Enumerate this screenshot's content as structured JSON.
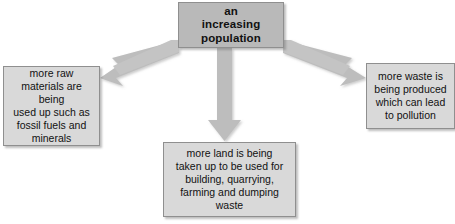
{
  "diagram": {
    "type": "cause-and-effect flowchart",
    "colors": {
      "background": "#ffffff",
      "cause_box_fill": "#b9b9b9",
      "effect_box_fill": "#d9d9d9",
      "box_border": "#8f8f8f",
      "arrow_fill": "#bdbdbd",
      "text": "#111111"
    },
    "cause": {
      "id": "increasing-population",
      "label": "an\nincreasing\npopulation"
    },
    "effects": [
      {
        "id": "raw-materials",
        "label": "more raw\nmaterials are being\nused up such as\nfossil fuels and\nminerals"
      },
      {
        "id": "land-use",
        "label": "more land is being\ntaken up to be used for\nbuilding, quarrying,\nfarming and dumping\nwaste"
      },
      {
        "id": "waste",
        "label": "more waste is\nbeing produced\nwhich can lead\nto pollution"
      }
    ],
    "arrows": [
      {
        "id": "arrow-to-raw-materials",
        "direction": "down-left",
        "from": "increasing-population",
        "to": "raw-materials"
      },
      {
        "id": "arrow-to-land-use",
        "direction": "down",
        "from": "increasing-population",
        "to": "land-use"
      },
      {
        "id": "arrow-to-waste",
        "direction": "down-right",
        "from": "increasing-population",
        "to": "waste"
      }
    ]
  }
}
